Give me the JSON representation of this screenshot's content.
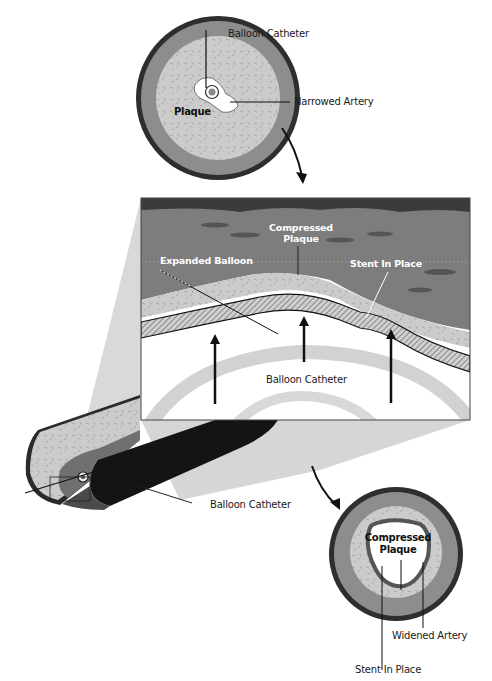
{
  "diagram": {
    "colors": {
      "outer_wall": "#3a3a3a",
      "media": "#8a8a8a",
      "plaque": "#c9c9c9",
      "lumen": "#ffffff",
      "vessel_tissue": "#7a7a7a",
      "vessel_top": "#3c3c3c",
      "balloon_band": "#d4d4d4",
      "catheter": "#161616",
      "stent_hatch": "#9a9a9a"
    },
    "top_section": {
      "label_catheter": "Balloon Catheter",
      "label_narrowed": "Narrowed Artery",
      "label_plaque": "Plaque"
    },
    "detail_panel": {
      "label_compressed": "Compressed\nPlaque",
      "label_compressed_line1": "Compressed",
      "label_compressed_line2": "Plaque",
      "label_expanded": "Expanded Balloon",
      "label_stent": "Stent In Place",
      "label_catheter": "Balloon Catheter"
    },
    "tube": {
      "label_catheter": "Balloon Catheter"
    },
    "bottom_section": {
      "label_compressed_line1": "Compressed",
      "label_compressed_line2": "Plaque",
      "label_widened": "Widened Artery",
      "label_stent": "Stent In Place"
    }
  }
}
